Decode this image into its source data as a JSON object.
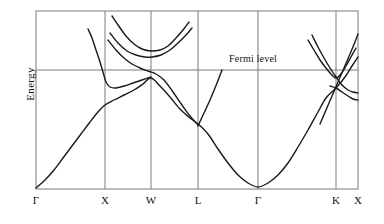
{
  "figure": {
    "title": "",
    "type": "band-structure-diagram",
    "axis_label_y": "Energy",
    "fermi_label": "Fermi level",
    "background": "#ffffff",
    "line_color": "#1a1a1a",
    "frame_color": "#7a7a7a"
  },
  "chart_data": {
    "type": "line",
    "title": "",
    "xlabel": "",
    "ylabel": "Energy",
    "grid": true,
    "legend": null,
    "xlim": [
      0,
      1
    ],
    "ylim": [
      0,
      1
    ],
    "annotations": [
      {
        "text": "Fermi level",
        "x": 0.63,
        "y": 0.67,
        "kind": "horizontal-line-label"
      }
    ],
    "xticks": [
      {
        "label": "Γ",
        "px": 36,
        "value": 0.0
      },
      {
        "label": "X",
        "px": 105,
        "value": 0.214
      },
      {
        "label": "W",
        "px": 151,
        "value": 0.357
      },
      {
        "label": "L",
        "px": 198,
        "value": 0.503
      },
      {
        "label": "Γ",
        "px": 258,
        "value": 0.689
      },
      {
        "label": "K",
        "px": 336,
        "value": 0.932
      },
      {
        "label": "X",
        "px": 358,
        "value": 1.0
      }
    ],
    "gridlines_x_px": [
      105,
      151,
      198,
      258,
      336
    ],
    "fermi_level_px_y": 70,
    "frame_px": {
      "left": 36,
      "right": 358,
      "top": 11,
      "bottom": 189
    },
    "series": [
      {
        "name": "valence-band-lower",
        "description": "Lowest band rising from Gamma at bottom-left up through X, crossing to W, descending to L minimum, parabolic dip to second Gamma at bottom, rising to K and X.",
        "points_px": [
          [
            36,
            188
          ],
          [
            45,
            180
          ],
          [
            54,
            170
          ],
          [
            63,
            158
          ],
          [
            72,
            146
          ],
          [
            81,
            134
          ],
          [
            90,
            122
          ],
          [
            98,
            112
          ],
          [
            105,
            105
          ],
          [
            114,
            100
          ],
          [
            124,
            95
          ],
          [
            134,
            90
          ],
          [
            143,
            84
          ],
          [
            151,
            78
          ],
          [
            160,
            86
          ],
          [
            170,
            97
          ],
          [
            180,
            109
          ],
          [
            190,
            118
          ],
          [
            198,
            124
          ],
          [
            208,
            134
          ],
          [
            218,
            149
          ],
          [
            228,
            163
          ],
          [
            238,
            175
          ],
          [
            248,
            183
          ],
          [
            258,
            187
          ],
          [
            268,
            183
          ],
          [
            278,
            175
          ],
          [
            288,
            163
          ],
          [
            298,
            147
          ],
          [
            308,
            130
          ],
          [
            318,
            112
          ],
          [
            326,
            98
          ],
          [
            336,
            88
          ],
          [
            345,
            77
          ],
          [
            352,
            66
          ],
          [
            358,
            57
          ]
        ]
      },
      {
        "name": "valence-band-upper-X-branch",
        "description": "Band descending from top-left into a minimum just left of X then rising toward W.",
        "points_px": [
          [
            88,
            29
          ],
          [
            92,
            38
          ],
          [
            96,
            50
          ],
          [
            100,
            62
          ],
          [
            103,
            72
          ],
          [
            106,
            82
          ],
          [
            110,
            87
          ],
          [
            116,
            88
          ],
          [
            124,
            86
          ],
          [
            133,
            83
          ],
          [
            142,
            80
          ],
          [
            151,
            77
          ]
        ]
      },
      {
        "name": "conduction-band-W-dip",
        "description": "Band from upper-left descending into a shallow minimum at W then rising to the right.",
        "points_px": [
          [
            112,
            16
          ],
          [
            118,
            25
          ],
          [
            126,
            36
          ],
          [
            134,
            44
          ],
          [
            142,
            49
          ],
          [
            151,
            51
          ],
          [
            160,
            50
          ],
          [
            168,
            46
          ],
          [
            176,
            38
          ],
          [
            183,
            30
          ],
          [
            189,
            22
          ]
        ]
      },
      {
        "name": "conduction-band-upper-W",
        "description": "Higher band with a broad minimum above W rising on both sides.",
        "points_px": [
          [
            110,
            33
          ],
          [
            118,
            43
          ],
          [
            127,
            51
          ],
          [
            136,
            55
          ],
          [
            145,
            57
          ],
          [
            152,
            57
          ],
          [
            161,
            55
          ],
          [
            170,
            50
          ],
          [
            178,
            43
          ],
          [
            186,
            35
          ],
          [
            192,
            28
          ]
        ]
      },
      {
        "name": "band-crossing-X-to-W-descending",
        "description": "Band that crosses the Fermi level between X and W then descends toward L.",
        "points_px": [
          [
            108,
            40
          ],
          [
            116,
            50
          ],
          [
            124,
            58
          ],
          [
            132,
            64
          ],
          [
            140,
            68
          ],
          [
            148,
            71
          ],
          [
            156,
            74
          ],
          [
            164,
            80
          ],
          [
            173,
            92
          ],
          [
            182,
            105
          ],
          [
            190,
            116
          ],
          [
            198,
            125
          ]
        ]
      },
      {
        "name": "band-L-rising",
        "description": "Steeply rising line out of the L point toward the Fermi level.",
        "points_px": [
          [
            198,
            126
          ],
          [
            204,
            113
          ],
          [
            210,
            100
          ],
          [
            215,
            88
          ],
          [
            219,
            78
          ],
          [
            222,
            70
          ]
        ]
      },
      {
        "name": "band-right-K-upper",
        "description": "Band descending from upper right region into a minimum at K then rising.",
        "points_px": [
          [
            308,
            40
          ],
          [
            314,
            50
          ],
          [
            320,
            60
          ],
          [
            326,
            68
          ],
          [
            331,
            74
          ],
          [
            336,
            78
          ],
          [
            341,
            74
          ],
          [
            346,
            66
          ],
          [
            351,
            57
          ],
          [
            356,
            48
          ]
        ]
      },
      {
        "name": "band-right-K-lower",
        "description": "Second right-hand band crossing near K and flattening toward X.",
        "points_px": [
          [
            312,
            35
          ],
          [
            318,
            47
          ],
          [
            324,
            58
          ],
          [
            330,
            68
          ],
          [
            336,
            77
          ],
          [
            342,
            85
          ],
          [
            348,
            90
          ],
          [
            353,
            92
          ],
          [
            358,
            93
          ]
        ]
      },
      {
        "name": "band-right-flat-tail",
        "description": "Nearly flat band from the K crossing out to the right frame edge.",
        "points_px": [
          [
            330,
            86
          ],
          [
            336,
            88
          ],
          [
            342,
            92
          ],
          [
            348,
            96
          ],
          [
            353,
            99
          ],
          [
            358,
            100
          ]
        ]
      },
      {
        "name": "band-right-steep",
        "description": "Steep band rising through the right frame region past K toward the top-right.",
        "points_px": [
          [
            320,
            124
          ],
          [
            326,
            110
          ],
          [
            332,
            96
          ],
          [
            338,
            82
          ],
          [
            344,
            68
          ],
          [
            350,
            54
          ],
          [
            355,
            42
          ],
          [
            358,
            34
          ]
        ]
      }
    ]
  },
  "xticks_labels": [
    "Γ",
    "X",
    "W",
    "L",
    "Γ",
    "K",
    "X"
  ]
}
